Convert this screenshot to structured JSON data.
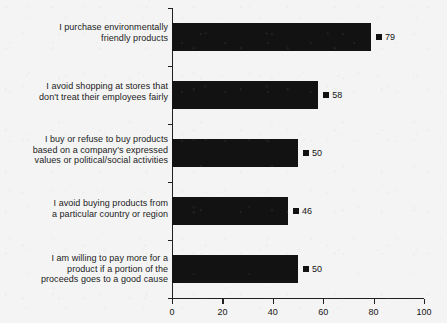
{
  "chart_data": {
    "type": "bar",
    "orientation": "horizontal",
    "title": "",
    "subtitle": "",
    "xlabel": "",
    "ylabel": "",
    "xlim": [
      0,
      100
    ],
    "xticks": [
      0,
      20,
      40,
      60,
      80,
      100
    ],
    "xtick_labels": [
      "0",
      "20",
      "40",
      "60",
      "80",
      "100"
    ],
    "grid": false,
    "legend": false,
    "bar_color": "#121212",
    "marker_color": "#121212",
    "background_color": "#f4f4f4",
    "axis_color": "#202020",
    "categories": [
      "I purchase environmentally\nfriendly products",
      "I avoid shopping at stores that\ndon't treat their employees fairly",
      "I buy or refuse to buy products\nbased on a company's expressed\nvalues or political/social activities",
      "I avoid buying products from\na particular country or region",
      "I am willing to pay more for a\nproduct if a portion of the\nproceeds goes to a good cause"
    ],
    "values": [
      79,
      58,
      50,
      46,
      50
    ],
    "value_labels": [
      "79",
      "58",
      "50",
      "46",
      "50"
    ]
  }
}
